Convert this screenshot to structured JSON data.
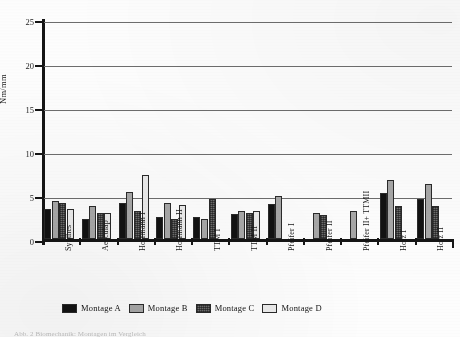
{
  "figure": {
    "caption_partial": "Abb. 2  Biomechanik: Montagen im Vergleich"
  },
  "chart_data": {
    "type": "bar",
    "title": "",
    "xlabel": "",
    "ylabel": "Nm/mm",
    "ylim": [
      0,
      25
    ],
    "yticks": [
      0,
      5,
      10,
      15,
      20,
      25
    ],
    "grid": "horizontal",
    "legend_position": "bottom",
    "categories": [
      "Synthes",
      "Aesculap",
      "Hoffmann I",
      "Hoffmann II",
      "TTM I",
      "TTM II",
      "Pfeifer I",
      "Pfeifer II",
      "Pfeifer II+ TTMII",
      "Holz I",
      "Holz II"
    ],
    "series": [
      {
        "name": "Montage A",
        "color": "#121212",
        "values": [
          3.4,
          2.3,
          4.1,
          2.5,
          2.5,
          2.8,
          4.0,
          null,
          null,
          5.2,
          4.6
        ]
      },
      {
        "name": "Montage B",
        "color": "#a8a8a8",
        "values": [
          4.3,
          3.7,
          5.3,
          4.1,
          2.3,
          3.2,
          4.9,
          2.9,
          3.2,
          6.7,
          6.2
        ]
      },
      {
        "name": "Montage C",
        "color": "#6d6d6d",
        "values": [
          4.1,
          2.9,
          3.2,
          2.3,
          4.5,
          3.0,
          null,
          2.7,
          null,
          3.8,
          3.8
        ]
      },
      {
        "name": "Montage D",
        "color": "#ececec",
        "values": [
          3.4,
          3.0,
          7.3,
          3.9,
          null,
          3.2,
          null,
          null,
          null,
          null,
          null
        ]
      }
    ]
  }
}
